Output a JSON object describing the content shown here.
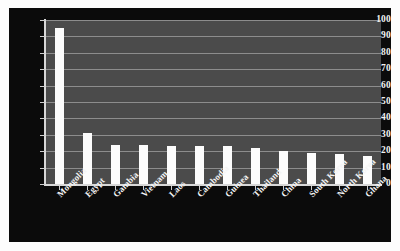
{
  "chart_data": {
    "type": "bar",
    "title": "",
    "xlabel": "",
    "ylabel": "",
    "ylim": [
      0,
      100
    ],
    "grid": true,
    "legend": false,
    "categories": [
      "Mongolia",
      "Egypt",
      "Gambia",
      "Vietnam",
      "Laos",
      "Cambodia",
      "Guinea",
      "Thailand",
      "China",
      "South Korea",
      "North Korea",
      "Ghana"
    ],
    "values": [
      95,
      31,
      24,
      24,
      23,
      23,
      23,
      22,
      20,
      19,
      18,
      17
    ],
    "y_ticks": [
      0,
      10,
      20,
      30,
      40,
      50,
      60,
      70,
      80,
      90,
      100
    ],
    "y_tick_labels": [
      "0",
      "10",
      "20",
      "30",
      "40",
      "50",
      "60",
      "70",
      "80",
      "90",
      "100"
    ],
    "colors": {
      "bar": "#fcfcfc",
      "plot_background": "#4b4b4b",
      "panel_background": "#0b0b0b",
      "gridline": "#8d8d8d",
      "axis": "#d8d8d8",
      "tick_text": "#f2f2f2"
    }
  }
}
